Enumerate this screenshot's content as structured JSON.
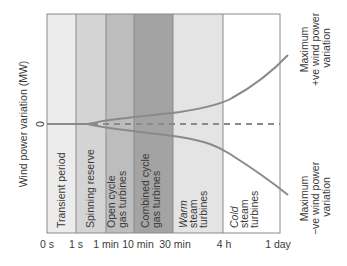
{
  "diagram": {
    "y_axis_title": "Wind power variation (MW)",
    "zero_label": "0",
    "bands": [
      {
        "id": "transient",
        "lines": [
          "Transient period"
        ],
        "italic_first": false,
        "x0": 47,
        "x1": 76,
        "fill": "#ececec"
      },
      {
        "id": "spinning",
        "lines": [
          "Spinning reserve"
        ],
        "italic_first": false,
        "x0": 76,
        "x1": 106,
        "fill": "#d4d4d4"
      },
      {
        "id": "ocgt",
        "lines": [
          "Open cycle",
          "gas turbines"
        ],
        "italic_first": false,
        "x0": 106,
        "x1": 134,
        "fill": "#bdbdbd"
      },
      {
        "id": "ccgt",
        "lines": [
          "Combined cycle",
          "gas turbines"
        ],
        "italic_first": false,
        "x0": 134,
        "x1": 173,
        "fill": "#a3a3a3"
      },
      {
        "id": "warm",
        "lines": [
          "Warm",
          "steam",
          "turbines"
        ],
        "italic_first": true,
        "x0": 173,
        "x1": 223,
        "fill": "#e4e4e4"
      },
      {
        "id": "cold",
        "lines": [
          "Cold",
          "steam",
          "turbines"
        ],
        "italic_first": true,
        "x0": 223,
        "x1": 280,
        "fill": "#ffffff"
      }
    ],
    "time_ticks": [
      {
        "label": "0 s",
        "x": 47
      },
      {
        "label": "1 s",
        "x": 76
      },
      {
        "label": "1 min",
        "x": 106
      },
      {
        "label": "10 min",
        "x": 134
      },
      {
        "label": "30 min",
        "x": 173
      },
      {
        "label": "4 h",
        "x": 223
      },
      {
        "label": "1 day",
        "x": 280
      }
    ],
    "upper_curve_label": [
      "Maximum",
      "+ve wind power",
      "variation"
    ],
    "lower_curve_label": [
      "Maximum",
      "−ve wind power",
      "variation"
    ],
    "colors": {
      "border": "#8a8a8a",
      "curve": "#8a8a8a",
      "dashed_line": "#8a8a8a",
      "text": "#3a3a3a"
    }
  }
}
